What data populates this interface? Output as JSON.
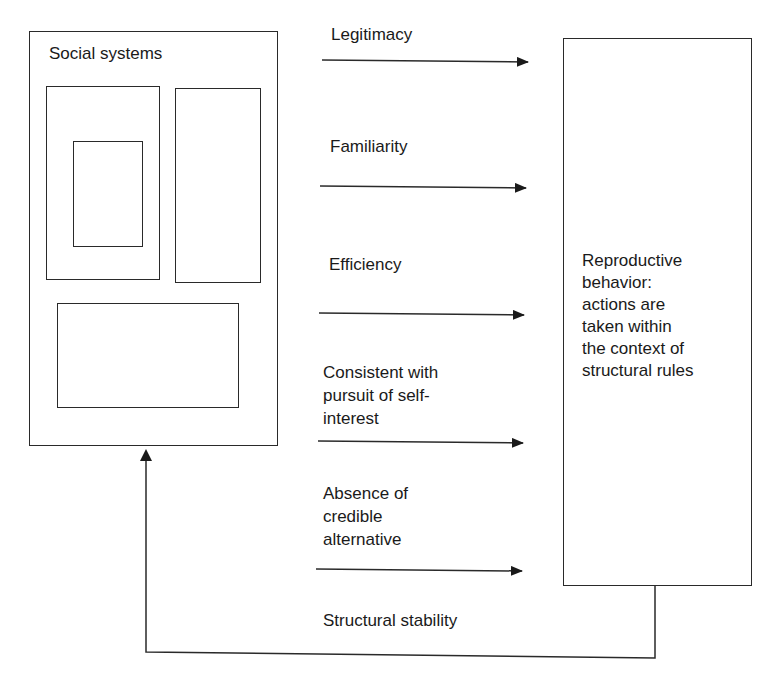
{
  "diagram": {
    "left_box": {
      "title": "Social systems",
      "inner_boxes": 4
    },
    "right_box": {
      "text": "Reproductive\nbehavior:\nactions are\ntaken within\nthe context of\nstructural rules"
    },
    "arrows": [
      {
        "label": "Legitimacy"
      },
      {
        "label": "Familiarity"
      },
      {
        "label": "Efficiency"
      },
      {
        "label": "Consistent with\npursuit of self-\ninterest"
      },
      {
        "label": "Absence of\ncredible\nalternative"
      }
    ],
    "feedback": {
      "label": "Structural stability"
    },
    "colors": {
      "line": "#2a2a2a",
      "text": "#1a1a1a",
      "background": "#ffffff"
    }
  }
}
